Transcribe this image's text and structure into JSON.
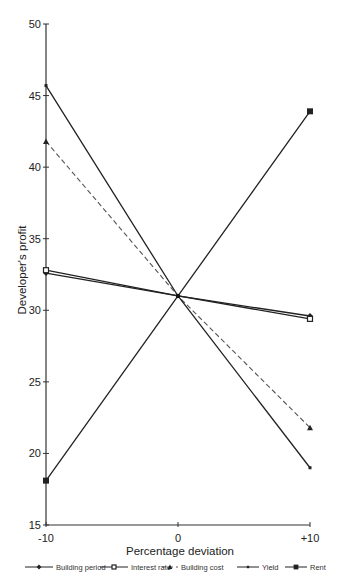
{
  "chart_data": {
    "type": "line",
    "title": "",
    "xlabel": "Percentage deviation",
    "ylabel": "Developer's profit",
    "x": [
      -10,
      0,
      10
    ],
    "x_tick_labels": [
      "-10",
      "0",
      "+10"
    ],
    "y_ticks": [
      15,
      20,
      25,
      30,
      35,
      40,
      45,
      50
    ],
    "xlim": [
      -10,
      10
    ],
    "ylim": [
      15,
      50
    ],
    "grid": false,
    "legend_position": "bottom",
    "series": [
      {
        "name": "Building period",
        "values": [
          32.6,
          31.0,
          29.6
        ],
        "marker": "diamond",
        "style": "solid",
        "color": "#222222"
      },
      {
        "name": "Interest rate",
        "values": [
          32.8,
          31.0,
          29.4
        ],
        "marker": "square-open",
        "style": "solid",
        "color": "#222222"
      },
      {
        "name": "Building cost",
        "values": [
          41.8,
          31.0,
          21.8
        ],
        "marker": "triangle",
        "style": "dashed",
        "color": "#555555"
      },
      {
        "name": "Yield",
        "values": [
          45.7,
          31.0,
          19.0
        ],
        "marker": "dot",
        "style": "solid",
        "color": "#222222"
      },
      {
        "name": "Rent",
        "values": [
          18.1,
          31.0,
          43.9
        ],
        "marker": "square",
        "style": "solid",
        "color": "#222222"
      }
    ]
  }
}
